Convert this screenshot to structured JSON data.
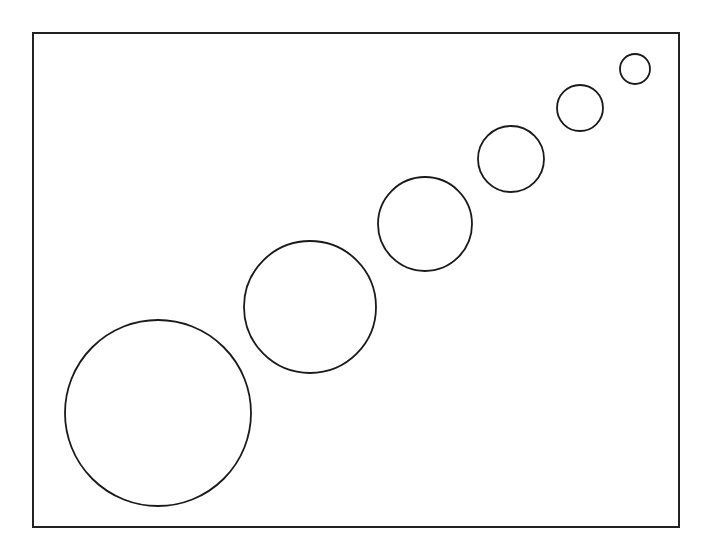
{
  "diagram": {
    "frame": {
      "x": 33,
      "y": 33,
      "width": 646,
      "height": 494,
      "stroke": "#222222",
      "stroke_width": 2
    },
    "circle_stroke": "#1a1a1a",
    "circle_stroke_width": 1.8,
    "circles": [
      {
        "cx": 158,
        "cy": 413,
        "r": 93
      },
      {
        "cx": 310,
        "cy": 307,
        "r": 66
      },
      {
        "cx": 425,
        "cy": 224,
        "r": 47
      },
      {
        "cx": 511,
        "cy": 159,
        "r": 33
      },
      {
        "cx": 580,
        "cy": 108,
        "r": 23
      },
      {
        "cx": 635,
        "cy": 69,
        "r": 15
      }
    ]
  }
}
